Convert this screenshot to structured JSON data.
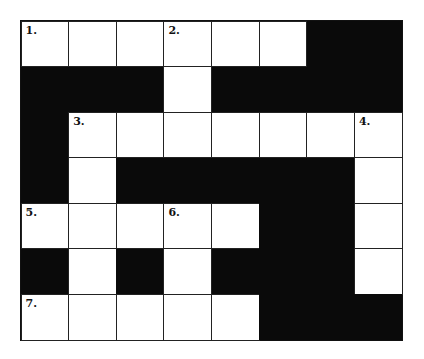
{
  "puzzle": {
    "rows": 7,
    "cols": 8,
    "colors": {
      "white": "#ffffff",
      "black": "#0a0a0a"
    },
    "grid": [
      [
        "W",
        "W",
        "W",
        "W",
        "W",
        "W",
        "B",
        "B"
      ],
      [
        "B",
        "B",
        "B",
        "W",
        "B",
        "B",
        "B",
        "B"
      ],
      [
        "B",
        "W",
        "W",
        "W",
        "W",
        "W",
        "W",
        "W"
      ],
      [
        "B",
        "W",
        "B",
        "B",
        "B",
        "B",
        "B",
        "W"
      ],
      [
        "W",
        "W",
        "W",
        "W",
        "W",
        "B",
        "B",
        "W"
      ],
      [
        "B",
        "W",
        "B",
        "W",
        "B",
        "B",
        "B",
        "W"
      ],
      [
        "W",
        "W",
        "W",
        "W",
        "W",
        "B",
        "B",
        "B"
      ]
    ],
    "numbers": [
      {
        "row": 0,
        "col": 0,
        "label": "1."
      },
      {
        "row": 0,
        "col": 3,
        "label": "2."
      },
      {
        "row": 2,
        "col": 1,
        "label": "3."
      },
      {
        "row": 2,
        "col": 7,
        "label": "4."
      },
      {
        "row": 4,
        "col": 0,
        "label": "5."
      },
      {
        "row": 4,
        "col": 3,
        "label": "6."
      },
      {
        "row": 6,
        "col": 0,
        "label": "7."
      }
    ]
  }
}
